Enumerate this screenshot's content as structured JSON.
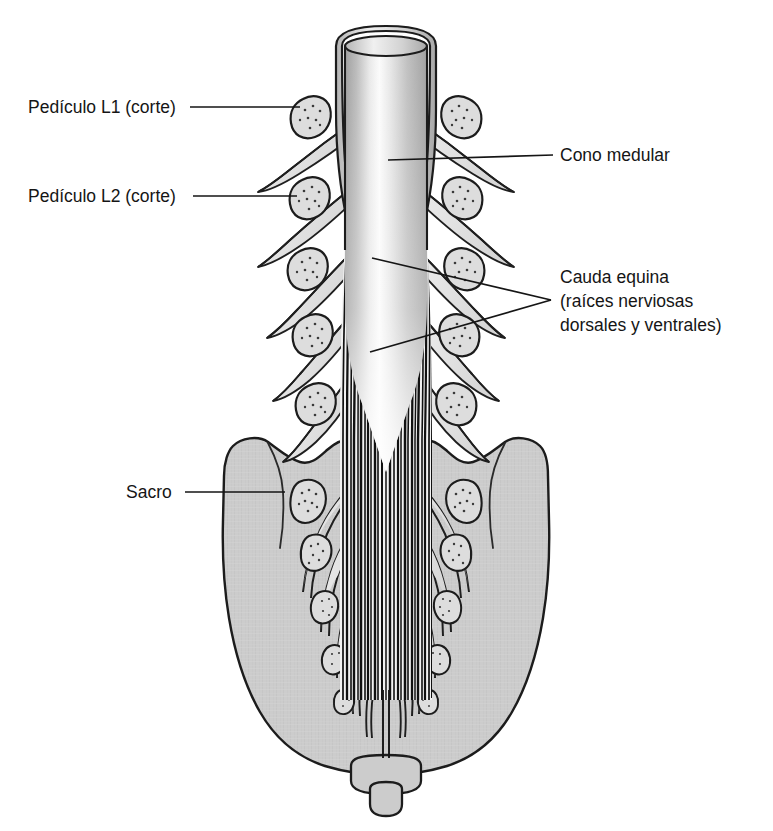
{
  "figure": {
    "background_color": "#ffffff",
    "ink_color": "#151515",
    "bone_fill": "#cccccc",
    "foramen_fill": "#dcdcdc",
    "cord_fill": "#c4c4c4",
    "root_fill": "#e2e2e2"
  },
  "labels": {
    "pediculo_l1": "Pedículo L1 (corte)",
    "pediculo_l2": "Pedículo L2 (corte)",
    "sacro": "Sacro",
    "cono_medular": "Cono medular",
    "cauda_equina_line1": "Cauda equina",
    "cauda_equina_line2": "(raíces nerviosas",
    "cauda_equina_line3": "dorsales y ventrales)"
  },
  "structures": {
    "spinal_cord": "medula-espinal-cono-medular",
    "dura_sheath": "duramadre-corte",
    "cauda_equina": "cauda-equina-haz-de-raices",
    "filum_terminale": "filum-terminale",
    "sacrum": "sacro",
    "coccyx": "coccix",
    "lumbar_pedicles_per_side": 5,
    "sacral_foramina_per_side": 5
  }
}
